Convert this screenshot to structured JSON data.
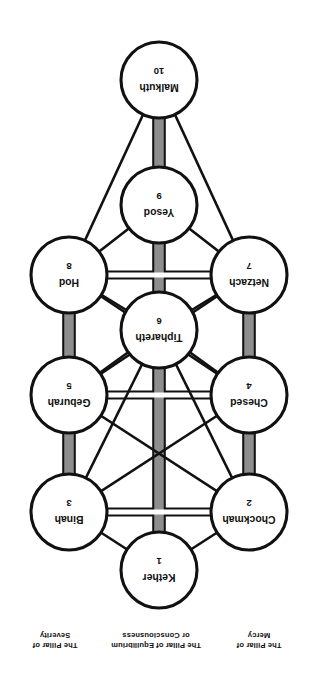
{
  "figure": {
    "orientation": "rotated-180",
    "colors": {
      "background": "#ffffff",
      "outline": "#111111",
      "node_fill": "#ffffff",
      "pillar_band": "#8e8e8e",
      "open_path_fill": "#ffffff"
    }
  },
  "pillars": [
    {
      "id": "mercy",
      "lines": [
        "The Pillar of",
        "Mercy"
      ],
      "side": "left"
    },
    {
      "id": "equilibrium",
      "lines": [
        "The Pillar of Equilibrium",
        "or Consciousness"
      ],
      "side": "center"
    },
    {
      "id": "severity",
      "lines": [
        "The Pillar of",
        "Severity"
      ],
      "side": "right"
    }
  ],
  "nodes": [
    {
      "id": "kether",
      "number": "1",
      "name": "Kether",
      "x": 160,
      "y": 104,
      "r": 38,
      "pillar": "equilibrium"
    },
    {
      "id": "chockmah",
      "number": "2",
      "name": "Chockmah",
      "x": 70,
      "y": 162,
      "r": 38,
      "pillar": "mercy"
    },
    {
      "id": "binah",
      "number": "3",
      "name": "Binah",
      "x": 250,
      "y": 162,
      "r": 38,
      "pillar": "severity"
    },
    {
      "id": "chesed",
      "number": "4",
      "name": "Chesed",
      "x": 70,
      "y": 279,
      "r": 38,
      "pillar": "mercy"
    },
    {
      "id": "geburah",
      "number": "5",
      "name": "Geburah",
      "x": 250,
      "y": 279,
      "r": 38,
      "pillar": "severity"
    },
    {
      "id": "tiphareth",
      "number": "6",
      "name": "Tiphareth",
      "x": 160,
      "y": 344,
      "r": 38,
      "pillar": "equilibrium"
    },
    {
      "id": "netzach",
      "number": "7",
      "name": "Netzach",
      "x": 70,
      "y": 399,
      "r": 38,
      "pillar": "mercy"
    },
    {
      "id": "hod",
      "number": "8",
      "name": "Hod",
      "x": 250,
      "y": 399,
      "r": 38,
      "pillar": "severity"
    },
    {
      "id": "yesod",
      "number": "9",
      "name": "Yesod",
      "x": 160,
      "y": 469,
      "r": 38,
      "pillar": "equilibrium"
    },
    {
      "id": "malkuth",
      "number": "10",
      "name": "Malkuth",
      "x": 160,
      "y": 594,
      "r": 38,
      "pillar": "equilibrium"
    }
  ],
  "paths": [
    {
      "from": "kether",
      "to": "chockmah",
      "style": "plain"
    },
    {
      "from": "kether",
      "to": "binah",
      "style": "plain"
    },
    {
      "from": "kether",
      "to": "tiphareth",
      "style": "band"
    },
    {
      "from": "chockmah",
      "to": "binah",
      "style": "open"
    },
    {
      "from": "chockmah",
      "to": "chesed",
      "style": "band"
    },
    {
      "from": "chockmah",
      "to": "tiphareth",
      "style": "plain"
    },
    {
      "from": "chockmah",
      "to": "geburah",
      "style": "plain"
    },
    {
      "from": "binah",
      "to": "geburah",
      "style": "band"
    },
    {
      "from": "binah",
      "to": "tiphareth",
      "style": "plain"
    },
    {
      "from": "binah",
      "to": "chesed",
      "style": "plain"
    },
    {
      "from": "chesed",
      "to": "geburah",
      "style": "open"
    },
    {
      "from": "chesed",
      "to": "tiphareth",
      "style": "plain"
    },
    {
      "from": "chesed",
      "to": "netzach",
      "style": "band"
    },
    {
      "from": "geburah",
      "to": "tiphareth",
      "style": "plain"
    },
    {
      "from": "geburah",
      "to": "hod",
      "style": "band"
    },
    {
      "from": "tiphareth",
      "to": "netzach",
      "style": "plain"
    },
    {
      "from": "tiphareth",
      "to": "hod",
      "style": "plain"
    },
    {
      "from": "tiphareth",
      "to": "yesod",
      "style": "band"
    },
    {
      "from": "netzach",
      "to": "hod",
      "style": "open"
    },
    {
      "from": "netzach",
      "to": "yesod",
      "style": "plain"
    },
    {
      "from": "netzach",
      "to": "malkuth",
      "style": "plain"
    },
    {
      "from": "hod",
      "to": "yesod",
      "style": "plain"
    },
    {
      "from": "hod",
      "to": "malkuth",
      "style": "plain"
    },
    {
      "from": "yesod",
      "to": "malkuth",
      "style": "band"
    },
    {
      "from": "chesed",
      "to": "hod",
      "style": "plain"
    },
    {
      "from": "geburah",
      "to": "netzach",
      "style": "plain"
    }
  ]
}
